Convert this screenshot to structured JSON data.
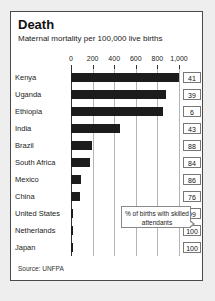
{
  "card": {
    "title": "Death",
    "subtitle": "Maternal mortality per 100,000 live births",
    "source": "Source: UNFPA",
    "callout": "% of births with skilled attendants"
  },
  "chart_data": {
    "type": "bar",
    "orientation": "horizontal",
    "title": "Death",
    "subtitle": "Maternal mortality per 100,000 live births",
    "xlabel": "",
    "ylabel": "",
    "xlim": [
      0,
      1000
    ],
    "grid": true,
    "legend": false,
    "ticks": [
      "0",
      "200",
      "400",
      "600",
      "800",
      "1,000"
    ],
    "tick_values": [
      0,
      200,
      400,
      600,
      800,
      1000
    ],
    "categories": [
      "Kenya",
      "Uganda",
      "Ethiopia",
      "India",
      "Brazil",
      "South Africa",
      "Mexico",
      "China",
      "United States",
      "Netherlands",
      "Japan"
    ],
    "values": [
      1000,
      880,
      850,
      450,
      190,
      180,
      90,
      80,
      17,
      16,
      10
    ],
    "annotation": "% of births with skilled attendants",
    "series": [
      {
        "name": "Maternal mortality per 100,000 live births",
        "values": [
          1000,
          880,
          850,
          450,
          190,
          180,
          90,
          80,
          17,
          16,
          10
        ]
      },
      {
        "name": "% of births with skilled attendants",
        "values": [
          41,
          39,
          6,
          43,
          88,
          84,
          86,
          76,
          99,
          100,
          100
        ]
      }
    ],
    "rows": [
      {
        "country": "Kenya",
        "mortality": 1000,
        "attendants": "41"
      },
      {
        "country": "Uganda",
        "mortality": 880,
        "attendants": "39"
      },
      {
        "country": "Ethiopia",
        "mortality": 850,
        "attendants": "6"
      },
      {
        "country": "India",
        "mortality": 450,
        "attendants": "43"
      },
      {
        "country": "Brazil",
        "mortality": 190,
        "attendants": "88"
      },
      {
        "country": "South Africa",
        "mortality": 180,
        "attendants": "84"
      },
      {
        "country": "Mexico",
        "mortality": 90,
        "attendants": "86"
      },
      {
        "country": "China",
        "mortality": 80,
        "attendants": "76"
      },
      {
        "country": "United States",
        "mortality": 17,
        "attendants": "99"
      },
      {
        "country": "Netherlands",
        "mortality": 16,
        "attendants": "100"
      },
      {
        "country": "Japan",
        "mortality": 10,
        "attendants": "100"
      }
    ]
  }
}
